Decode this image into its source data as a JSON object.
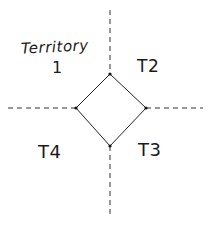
{
  "diagram": {
    "type": "territory-quadrant-sketch",
    "style": "hand-drawn",
    "colors": {
      "background": "#ffffff",
      "stroke": "#222222",
      "text": "#1a1a1a"
    },
    "territories": [
      {
        "id": "t1",
        "label_line1": "Territory",
        "label_line2": "1",
        "quadrant": "top-left"
      },
      {
        "id": "t2",
        "label": "T2",
        "quadrant": "top-right"
      },
      {
        "id": "t3",
        "label": "T3",
        "quadrant": "bottom-right"
      },
      {
        "id": "t4",
        "label": "T4",
        "quadrant": "bottom-left"
      }
    ],
    "center_diamond": {
      "top": [
        110,
        74
      ],
      "right": [
        146,
        108
      ],
      "bottom": [
        110,
        146
      ],
      "left": [
        76,
        108
      ]
    },
    "dashed_axes": {
      "vertical": {
        "x": 110,
        "y_start": 10,
        "y_end": 215
      },
      "horizontal": {
        "y": 108,
        "x_start": 8,
        "x_end": 203
      }
    }
  }
}
